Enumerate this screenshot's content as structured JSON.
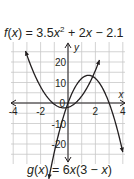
{
  "chart_data": {
    "type": "line",
    "title": "",
    "xlabel": "x",
    "ylabel": "y",
    "xlim": [
      -4.2,
      4.2
    ],
    "ylim": [
      -30,
      30
    ],
    "grid": true,
    "x_gridlines": [
      -4,
      -3,
      -2,
      -1,
      0,
      1,
      2,
      3,
      4
    ],
    "y_gridlines": [
      -30,
      -25,
      -20,
      -15,
      -10,
      -5,
      0,
      5,
      10,
      15,
      20,
      25
    ],
    "x_tick_labels": [
      "-4",
      "-2",
      "2",
      "4"
    ],
    "x_tick_values": [
      -4,
      -2,
      2,
      4
    ],
    "y_tick_labels": [
      "20",
      "10",
      "-10",
      "-20"
    ],
    "y_tick_values": [
      20,
      10,
      -10,
      -20
    ],
    "series": [
      {
        "name": "f(x) = 3.5x² + 2x − 2.1",
        "formula": "3.5*x^2 + 2*x - 2.1",
        "x": [
          -3.1,
          -3,
          -2.5,
          -2,
          -1.5,
          -1,
          -0.5,
          -0.286,
          0,
          0.5,
          1,
          1.5,
          2.3
        ],
        "values": [
          25.3,
          23.4,
          14.8,
          7.9,
          2.8,
          -0.6,
          -2.2,
          -2.39,
          -2.1,
          0.8,
          3.4,
          8.8,
          21.0
        ]
      },
      {
        "name": "g(x) = 6x(3 − x)",
        "formula": "6*x*(3-x)",
        "x": [
          -1.4,
          -1,
          -0.5,
          0,
          0.5,
          1,
          1.5,
          2,
          2.5,
          3,
          3.5,
          4.0
        ],
        "values": [
          -36.96,
          -24,
          -10.5,
          0,
          7.5,
          12,
          13.5,
          12,
          7.5,
          0,
          -10.5,
          -24
        ]
      }
    ],
    "annotations": [
      {
        "text": "f(x) = 3.5x² + 2x − 2.1",
        "position": "top"
      },
      {
        "text": "g(x) = 6x(3 − x)",
        "position": "bottom"
      }
    ],
    "legend": "none"
  },
  "labels": {
    "f_equation": {
      "name": "f",
      "arg": "x",
      "coef2": "3.5",
      "var": "x",
      "exp": "2",
      "plus": "+",
      "coef1": "2",
      "minus": "−",
      "const": "2.1"
    },
    "g_equation": {
      "name": "g",
      "arg": "x",
      "coef": "6",
      "var": "x",
      "inner_const": "3",
      "minus": "−"
    },
    "x_axis_label": "x",
    "y_axis_label": "y"
  },
  "colors": {
    "grid": "#c8c8c8",
    "axis": "#231f20",
    "curve": "#231f20",
    "background": "#ffffff"
  }
}
